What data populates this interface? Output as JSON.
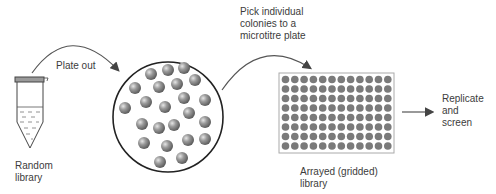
{
  "labels": {
    "plate_out": "Plate out",
    "pick_colonies": "Pick individual\ncolonies to a\nmicrotitre plate",
    "random_library": "Random\nlibrary",
    "arrayed_library": "Arrayed (gridded)\nlibrary",
    "replicate_screen": "Replicate\nand\nscreen"
  },
  "steps": [
    {
      "name": "tube",
      "label": "Random library"
    },
    {
      "name": "petri-dish",
      "label": "Plate out"
    },
    {
      "name": "microtitre-plate",
      "label": "Arrayed (gridded) library"
    },
    {
      "name": "output",
      "label": "Replicate and screen"
    }
  ],
  "plate": {
    "rows": 8,
    "cols": 12
  },
  "colors": {
    "line": "#3a3a3a",
    "colony": "#8a8a8a",
    "well": "#7a7a7a",
    "cap": "#9a9a9a"
  }
}
